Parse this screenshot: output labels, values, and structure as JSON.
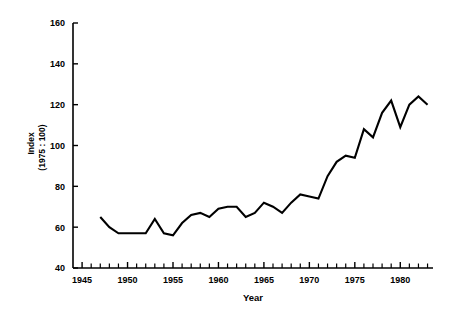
{
  "chart_data": {
    "type": "line",
    "title": "",
    "xlabel": "Year",
    "ylabel": "Index\n(1975 : 100)",
    "ylabel_line1": "Index",
    "ylabel_line2": "(1975 : 100)",
    "xlim": [
      1944.0,
      1983.6
    ],
    "ylim": [
      40,
      160
    ],
    "ytick_values": [
      40,
      60,
      80,
      100,
      120,
      140,
      160
    ],
    "ytick_labels": [
      "40",
      "60",
      "80",
      "100",
      "120",
      "140",
      "160"
    ],
    "xtick_values": [
      1945,
      1950,
      1955,
      1960,
      1965,
      1970,
      1975,
      1980
    ],
    "xtick_labels": [
      "1945",
      "1950",
      "1955",
      "1960",
      "1965",
      "1970",
      "1975",
      "1980"
    ],
    "x_minor_step": 1,
    "x_minor_start": 1945,
    "x_minor_end": 1983,
    "grid": false,
    "legend": false,
    "legend_position": "none",
    "line_color": "#000000",
    "background_color": "#ffffff",
    "series": [
      {
        "name": "Index (1975 : 100)",
        "x": [
          1947,
          1948,
          1949,
          1950,
          1951,
          1952,
          1953,
          1954,
          1955,
          1956,
          1957,
          1958,
          1959,
          1960,
          1961,
          1962,
          1963,
          1964,
          1965,
          1966,
          1967,
          1968,
          1969,
          1970,
          1971,
          1972,
          1973,
          1974,
          1975,
          1976,
          1977,
          1978,
          1979,
          1980,
          1981,
          1982,
          1983
        ],
        "values": [
          65,
          60,
          57,
          57,
          57,
          57,
          64,
          57,
          56,
          62,
          66,
          67,
          65,
          69,
          70,
          70,
          65,
          67,
          72,
          70,
          67,
          72,
          76,
          75,
          74,
          85,
          92,
          95,
          94,
          108,
          104,
          116,
          122,
          109,
          120,
          124,
          120
        ]
      }
    ]
  },
  "axis_labels": {
    "x_title": "Year",
    "y_title_line1": "Index",
    "y_title_line2": "(1975 : 100)"
  }
}
